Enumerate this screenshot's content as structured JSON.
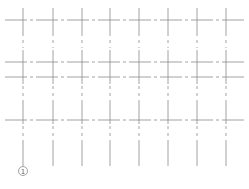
{
  "diagram": {
    "type": "structural-grid",
    "line_color": "#8a8a8a",
    "vertical_grid_x": [
      23,
      53,
      82,
      110,
      139,
      168,
      197,
      226
    ],
    "horizontal_grid_y": [
      20,
      62,
      77,
      120
    ],
    "axis_bubbles": [
      {
        "label": "1",
        "x": 23,
        "y": 171
      }
    ]
  }
}
